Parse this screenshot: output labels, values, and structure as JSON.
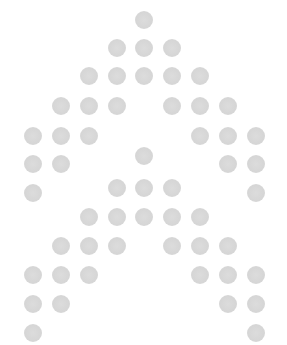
{
  "figure": {
    "dot_color": "#d8d8d8",
    "background": "#ffffff",
    "dot_diameter": 18,
    "dots": [
      [
        144,
        20
      ],
      [
        117,
        48
      ],
      [
        144,
        48
      ],
      [
        172,
        48
      ],
      [
        89,
        76
      ],
      [
        117,
        76
      ],
      [
        144,
        76
      ],
      [
        172,
        76
      ],
      [
        200,
        76
      ],
      [
        61,
        106
      ],
      [
        89,
        106
      ],
      [
        117,
        106
      ],
      [
        172,
        106
      ],
      [
        200,
        106
      ],
      [
        228,
        106
      ],
      [
        33,
        136
      ],
      [
        61,
        136
      ],
      [
        89,
        136
      ],
      [
        200,
        136
      ],
      [
        228,
        136
      ],
      [
        256,
        136
      ],
      [
        33,
        164
      ],
      [
        61,
        164
      ],
      [
        144,
        156
      ],
      [
        228,
        164
      ],
      [
        256,
        164
      ],
      [
        33,
        193
      ],
      [
        117,
        188
      ],
      [
        144,
        188
      ],
      [
        172,
        188
      ],
      [
        256,
        193
      ],
      [
        89,
        217
      ],
      [
        117,
        217
      ],
      [
        144,
        217
      ],
      [
        172,
        217
      ],
      [
        200,
        217
      ],
      [
        61,
        246
      ],
      [
        89,
        246
      ],
      [
        117,
        246
      ],
      [
        172,
        246
      ],
      [
        200,
        246
      ],
      [
        228,
        246
      ],
      [
        33,
        275
      ],
      [
        61,
        275
      ],
      [
        89,
        275
      ],
      [
        200,
        275
      ],
      [
        228,
        275
      ],
      [
        256,
        275
      ],
      [
        33,
        304
      ],
      [
        61,
        304
      ],
      [
        228,
        304
      ],
      [
        256,
        304
      ],
      [
        33,
        333
      ],
      [
        256,
        333
      ]
    ]
  }
}
